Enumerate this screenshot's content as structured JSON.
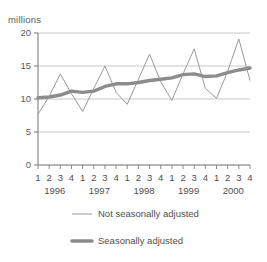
{
  "chart_data": {
    "type": "line",
    "title": "",
    "subtitle": "",
    "xlabel": "",
    "ylabel": "millions",
    "ylim": [
      0,
      20
    ],
    "yticks": [
      0,
      5,
      10,
      15,
      20
    ],
    "ytick_labels": [
      "0",
      "5",
      "10",
      "15",
      "20"
    ],
    "grid": true,
    "grid_axis": "y",
    "legend_position": "bottom",
    "x": [
      "1996 Q1",
      "1996 Q2",
      "1996 Q3",
      "1996 Q4",
      "1997 Q1",
      "1997 Q2",
      "1997 Q3",
      "1997 Q4",
      "1998 Q1",
      "1998 Q2",
      "1998 Q3",
      "1998 Q4",
      "1999 Q1",
      "1999 Q2",
      "1999 Q3",
      "1999 Q4",
      "2000 Q1",
      "2000 Q2",
      "2000 Q3",
      "2000 Q4"
    ],
    "quarter_labels": [
      "1",
      "2",
      "3",
      "4",
      "1",
      "2",
      "3",
      "4",
      "1",
      "2",
      "3",
      "4",
      "1",
      "2",
      "3",
      "4",
      "1",
      "2",
      "3",
      "4"
    ],
    "year_groups": [
      {
        "label": "1996",
        "start_index": 0,
        "end_index": 3
      },
      {
        "label": "1997",
        "start_index": 4,
        "end_index": 7
      },
      {
        "label": "1998",
        "start_index": 8,
        "end_index": 11
      },
      {
        "label": "1999",
        "start_index": 12,
        "end_index": 15
      },
      {
        "label": "2000",
        "start_index": 16,
        "end_index": 19
      }
    ],
    "series": [
      {
        "name": "Not seasonally adjusted",
        "color": "#9a9a9a",
        "line_width": 1,
        "values": [
          7.7,
          10.4,
          13.8,
          10.8,
          8.1,
          11.6,
          15.0,
          11.0,
          9.2,
          13.0,
          16.8,
          12.6,
          9.8,
          13.8,
          17.6,
          11.6,
          10.1,
          14.2,
          19.1,
          12.8
        ]
      },
      {
        "name": "Seasonally adjusted",
        "color": "#8c8c8c",
        "line_width": 3.4,
        "values": [
          10.2,
          10.3,
          10.6,
          11.2,
          11.0,
          11.2,
          11.9,
          12.3,
          12.3,
          12.5,
          12.8,
          13.0,
          13.2,
          13.7,
          13.8,
          13.4,
          13.5,
          14.0,
          14.4,
          14.7
        ]
      }
    ],
    "legend": [
      {
        "label": "Not seasonally adjusted",
        "color": "#9a9a9a",
        "line_width": 1
      },
      {
        "label": "Seasonally adjusted",
        "color": "#8c8c8c",
        "line_width": 3.4
      }
    ],
    "axis_color": "#8a8a8a",
    "grid_color": "#c8c8c8"
  }
}
